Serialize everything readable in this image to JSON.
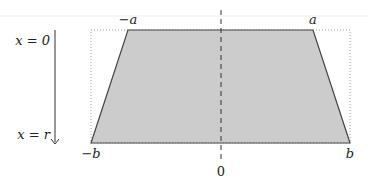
{
  "diagram": {
    "title": "",
    "shape": "trapezoid",
    "colors": {
      "fill": "#cccccc",
      "stroke": "#444444",
      "dotted": "#999999",
      "topline": "#eeeeee"
    },
    "labels": {
      "top_left": "−a",
      "top_right": "a",
      "bottom_left": "−b",
      "bottom_right": "b",
      "center": "0",
      "arrow_start": "x = 0",
      "arrow_end": "x = r"
    },
    "geometry": {
      "top_y": 30,
      "bottom_y": 143,
      "top_left_x": 128,
      "top_right_x": 313,
      "bottom_left_x": 91,
      "bottom_right_x": 350,
      "center_x": 221
    }
  }
}
